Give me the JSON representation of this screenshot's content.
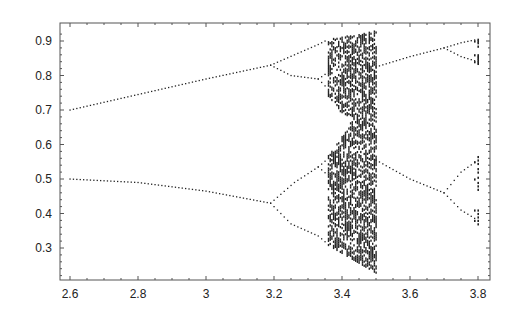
{
  "chart_data": {
    "type": "scatter",
    "title": "",
    "xlabel": "",
    "ylabel": "",
    "xlim": [
      2.57,
      3.83
    ],
    "ylim": [
      0.21,
      0.935
    ],
    "grid": false,
    "legend": null,
    "x_ticks": [
      2.6,
      2.8,
      3.0,
      3.2,
      3.4,
      3.6,
      3.8
    ],
    "x_tick_labels": [
      "2.6",
      "2.8",
      "3",
      "3.2",
      "3.4",
      "3.6",
      "3.8"
    ],
    "y_ticks": [
      0.3,
      0.4,
      0.5,
      0.6,
      0.7,
      0.8,
      0.9
    ],
    "y_tick_labels": [
      "0.3",
      "0.4",
      "0.5",
      "0.6",
      "0.7",
      "0.8",
      "0.9"
    ],
    "point_color": "#222222",
    "branches": [
      {
        "name": "upper-period2",
        "points": [
          [
            2.6,
            0.7
          ],
          [
            2.8,
            0.745
          ],
          [
            3.0,
            0.79
          ],
          [
            3.19,
            0.83
          ]
        ]
      },
      {
        "name": "lower-period2",
        "points": [
          [
            2.6,
            0.5
          ],
          [
            2.8,
            0.49
          ],
          [
            3.0,
            0.465
          ],
          [
            3.19,
            0.43
          ]
        ]
      },
      {
        "name": "upper-split-high",
        "points": [
          [
            3.19,
            0.83
          ],
          [
            3.26,
            0.86
          ],
          [
            3.33,
            0.89
          ],
          [
            3.36,
            0.905
          ]
        ]
      },
      {
        "name": "upper-split-low",
        "points": [
          [
            3.19,
            0.83
          ],
          [
            3.25,
            0.8
          ],
          [
            3.33,
            0.79
          ]
        ]
      },
      {
        "name": "upper-split-low-a",
        "points": [
          [
            3.33,
            0.79
          ],
          [
            3.36,
            0.81
          ]
        ]
      },
      {
        "name": "upper-split-low-b",
        "points": [
          [
            3.33,
            0.79
          ],
          [
            3.36,
            0.76
          ]
        ]
      },
      {
        "name": "lower-split-high",
        "points": [
          [
            3.19,
            0.43
          ],
          [
            3.26,
            0.49
          ],
          [
            3.33,
            0.535
          ]
        ]
      },
      {
        "name": "lower-split-high-a",
        "points": [
          [
            3.33,
            0.535
          ],
          [
            3.36,
            0.56
          ]
        ]
      },
      {
        "name": "lower-split-high-b",
        "points": [
          [
            3.33,
            0.535
          ],
          [
            3.36,
            0.51
          ]
        ]
      },
      {
        "name": "lower-split-low",
        "points": [
          [
            3.19,
            0.43
          ],
          [
            3.25,
            0.37
          ],
          [
            3.33,
            0.335
          ]
        ]
      },
      {
        "name": "lower-split-low-b",
        "points": [
          [
            3.33,
            0.335
          ],
          [
            3.36,
            0.31
          ]
        ]
      },
      {
        "name": "right-upper",
        "points": [
          [
            3.5,
            0.825
          ],
          [
            3.6,
            0.855
          ],
          [
            3.7,
            0.88
          ]
        ]
      },
      {
        "name": "right-upper-high",
        "points": [
          [
            3.7,
            0.88
          ],
          [
            3.75,
            0.895
          ],
          [
            3.8,
            0.905
          ]
        ]
      },
      {
        "name": "right-upper-low",
        "points": [
          [
            3.7,
            0.88
          ],
          [
            3.75,
            0.855
          ],
          [
            3.8,
            0.84
          ]
        ]
      },
      {
        "name": "right-lower",
        "points": [
          [
            3.5,
            0.555
          ],
          [
            3.6,
            0.5
          ],
          [
            3.7,
            0.46
          ]
        ]
      },
      {
        "name": "right-lower-high",
        "points": [
          [
            3.7,
            0.46
          ],
          [
            3.75,
            0.52
          ],
          [
            3.8,
            0.555
          ]
        ]
      },
      {
        "name": "right-lower-low",
        "points": [
          [
            3.7,
            0.46
          ],
          [
            3.75,
            0.41
          ],
          [
            3.8,
            0.38
          ]
        ]
      }
    ],
    "chaotic_band": {
      "r_start": 3.36,
      "r_end": 3.5,
      "column_step": 0.01,
      "upper_envelope": [
        [
          3.36,
          0.905
        ],
        [
          3.5,
          0.93
        ]
      ],
      "lower_envelope": [
        [
          3.36,
          0.31
        ],
        [
          3.5,
          0.23
        ]
      ],
      "gap_upper_band_bottom": [
        [
          3.36,
          0.74
        ],
        [
          3.45,
          0.63
        ],
        [
          3.5,
          0.56
        ]
      ],
      "gap_lower_band_top": [
        [
          3.36,
          0.57
        ],
        [
          3.45,
          0.69
        ],
        [
          3.5,
          0.78
        ]
      ]
    },
    "right_columns": [
      {
        "r": 3.8,
        "values": [
          0.905,
          0.9,
          0.895,
          0.885,
          0.86,
          0.855,
          0.85,
          0.845,
          0.84,
          0.835,
          0.565,
          0.555,
          0.545,
          0.53,
          0.52,
          0.505,
          0.49,
          0.48,
          0.47,
          0.41,
          0.4,
          0.39,
          0.38,
          0.37
        ]
      },
      {
        "r": 3.79,
        "values": [
          0.9,
          0.86,
          0.84,
          0.55,
          0.5,
          0.41,
          0.38
        ]
      }
    ]
  }
}
